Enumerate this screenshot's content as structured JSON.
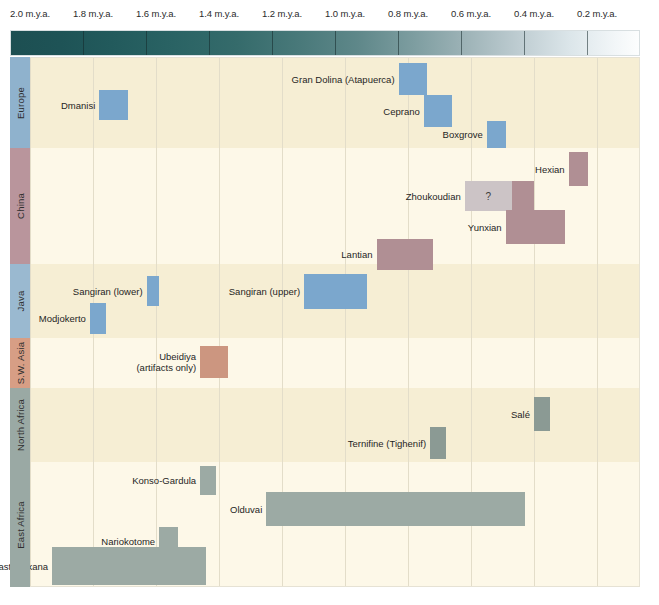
{
  "chart_data": {
    "type": "table",
    "title": "",
    "xlabel": "",
    "ylabel": "",
    "xlim": [
      2.1,
      0.05
    ],
    "axis_direction": "older-to-younger (left to right)",
    "grid": true,
    "legend": "none",
    "tick_labels": [
      "2.0 m.y.a.",
      "1.8 m.y.a.",
      "1.6 m.y.a.",
      "1.4 m.y.a.",
      "1.2 m.y.a.",
      "1.0 m.y.a.",
      "0.8 m.y.a.",
      "0.6 m.y.a.",
      "0.4 m.y.a.",
      "0.2 m.y.a."
    ],
    "tick_values": [
      2.0,
      1.8,
      1.6,
      1.4,
      1.2,
      1.0,
      0.8,
      0.6,
      0.4,
      0.2
    ],
    "colorbar": {
      "description": "time gradient ramp, dark teal (oldest) to white (youngest)",
      "from": "#1d4f52",
      "to": "#fdfefe"
    },
    "regions": [
      {
        "name": "Europe",
        "tab_color": "#8fb2cd",
        "band_color": "#f6eed4",
        "bar_color": "#7ba7cd",
        "sites": [
          {
            "label": "Gran Dolina (Atapuerca)",
            "start": 0.83,
            "end": 0.74
          },
          {
            "label": "Ceprano",
            "start": 0.75,
            "end": 0.66
          },
          {
            "label": "Boxgrove",
            "start": 0.55,
            "end": 0.49
          },
          {
            "label": "Dmanisi",
            "start": 1.78,
            "end": 1.69
          }
        ]
      },
      {
        "name": "China",
        "tab_color": "#b9959c",
        "band_color": "#fdf8e8",
        "bar_color": "#b08f94",
        "uncertain_color": "#ccc4c6",
        "sites": [
          {
            "label": "Hexian",
            "start": 0.29,
            "end": 0.23
          },
          {
            "label": "Zhoukoudian",
            "start": 0.62,
            "end": 0.4,
            "uncertain_until": 0.47,
            "marker": "?"
          },
          {
            "label": "Yunxian",
            "start": 0.49,
            "end": 0.3
          },
          {
            "label": "Lantian",
            "start": 0.9,
            "end": 0.72
          }
        ]
      },
      {
        "name": "Java",
        "tab_color": "#9ab9d0",
        "band_color": "#f6eed4",
        "bar_color": "#7ba7cd",
        "sites": [
          {
            "label": "Sangiran (lower)",
            "start": 1.63,
            "end": 1.59
          },
          {
            "label": "Sangiran (upper)",
            "start": 1.13,
            "end": 0.93
          },
          {
            "label": "Modjokerto",
            "start": 1.81,
            "end": 1.76
          }
        ]
      },
      {
        "name": "S.W. Asia",
        "tab_color": "#d79e85",
        "band_color": "#fdf8e8",
        "bar_color": "#cc9680",
        "sites": [
          {
            "label": "Ubeidiya",
            "sublabel": "(artifacts only)",
            "start": 1.46,
            "end": 1.37
          }
        ]
      },
      {
        "name": "North Africa",
        "tab_color": "#9aa9a4",
        "band_color": "#f6eed4",
        "bar_color": "#8b9a94",
        "sites": [
          {
            "label": "Salé",
            "start": 0.4,
            "end": 0.35
          },
          {
            "label": "Ternifine (Tighenif)",
            "start": 0.73,
            "end": 0.68
          }
        ]
      },
      {
        "name": "East Africa",
        "tab_color": "#9aa9a4",
        "band_color": "#fdf8e8",
        "bar_color": "#9caaa4",
        "sites": [
          {
            "label": "Konso-Gardula",
            "start": 1.46,
            "end": 1.41
          },
          {
            "label": "Olduvai",
            "start": 1.25,
            "end": 0.43
          },
          {
            "label": "Nariokotome",
            "start": 1.59,
            "end": 1.53
          },
          {
            "label": "East Turkana",
            "start": 1.93,
            "end": 1.44
          }
        ]
      }
    ]
  },
  "axis": {
    "ticks": [
      {
        "label": "2.0 m.y.a.",
        "x": 10
      },
      {
        "label": "1.8 m.y.a.",
        "x": 73
      },
      {
        "label": "1.6 m.y.a.",
        "x": 136
      },
      {
        "label": "1.4 m.y.a.",
        "x": 199
      },
      {
        "label": "1.2 m.y.a.",
        "x": 262
      },
      {
        "label": "1.0 m.y.a.",
        "x": 325
      },
      {
        "label": "0.8 m.y.a.",
        "x": 388
      },
      {
        "label": "0.6 m.y.a.",
        "x": 451
      },
      {
        "label": "0.4 m.y.a.",
        "x": 514
      },
      {
        "label": "0.2 m.y.a.",
        "x": 577
      }
    ]
  }
}
